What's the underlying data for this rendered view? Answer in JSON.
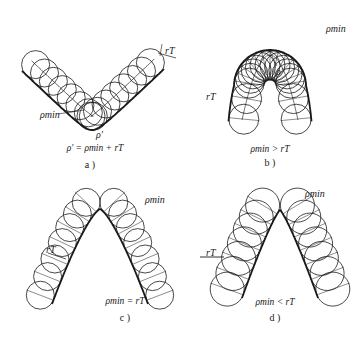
{
  "figure": {
    "panels": [
      {
        "id": "a",
        "tag": "a )",
        "condition": "ρ' = ρmin + rT",
        "condition_parts": {
          "lhs": "ρ'",
          "op": " = ",
          "rhs": "ρmin + rT"
        },
        "labels": {
          "rho_min": "ρmin",
          "rho_prime": "ρ'",
          "r_T": "rT"
        }
      },
      {
        "id": "b",
        "tag": "b )",
        "condition": "ρmin > rT",
        "condition_parts": {
          "lhs": "ρmin",
          "op": " > ",
          "rhs": "rT"
        },
        "labels": {
          "rho_min": "ρmin",
          "rho_prime": "ρ'",
          "r_T": "rT"
        }
      },
      {
        "id": "c",
        "tag": "c )",
        "condition": "ρmin = rT",
        "condition_parts": {
          "lhs": "ρmin",
          "op": " = ",
          "rhs": "rT"
        },
        "labels": {
          "rho_min": "ρmin",
          "r_T": "rT"
        }
      },
      {
        "id": "d",
        "tag": "d )",
        "condition": "ρmin < rT",
        "condition_parts": {
          "lhs": "ρmin",
          "op": " < ",
          "rhs": "rT"
        },
        "labels": {
          "rho_min": "ρmin",
          "r_T": "rT"
        }
      }
    ],
    "colors": {
      "ink": "#1a1a1a",
      "background": "#ffffff"
    }
  }
}
